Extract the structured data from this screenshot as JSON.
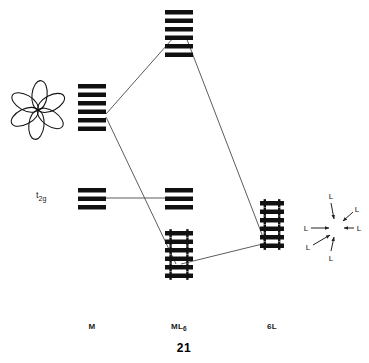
{
  "figure": {
    "number": "21",
    "type": "molecular-orbital-energy-level-diagram"
  },
  "columns": [
    {
      "key": "m",
      "label": "M",
      "label_sub": "",
      "x": 92,
      "label_y": 322
    },
    {
      "key": "ml6",
      "label": "ML",
      "label_sub": "6",
      "x": 179,
      "label_y": 322
    },
    {
      "key": "l6",
      "label": "6L",
      "label_sub": "",
      "x": 272,
      "label_y": 322
    }
  ],
  "orbital_labels": [
    {
      "text": "t",
      "sub": "2g",
      "x": 36,
      "y": 196
    }
  ],
  "ligand_field": {
    "center_x": 337,
    "center_y": 228,
    "ligands": [
      {
        "label": "L",
        "lx": 331,
        "ly": 196,
        "ax1": 331,
        "ay1": 203,
        "ax2": 334,
        "ay2": 219
      },
      {
        "label": "L",
        "lx": 357,
        "ly": 209,
        "ax1": 353,
        "ay1": 212,
        "ax2": 343,
        "ay2": 221
      },
      {
        "label": "L",
        "lx": 359,
        "ly": 228,
        "ax1": 354,
        "ay1": 228,
        "ax2": 344,
        "ay2": 228
      },
      {
        "label": "L",
        "lx": 306,
        "ly": 228,
        "ax1": 311,
        "ay1": 228,
        "ax2": 329,
        "ay2": 228
      },
      {
        "label": "L",
        "lx": 308,
        "ly": 247,
        "ax1": 313,
        "ay1": 245,
        "ax2": 330,
        "ay2": 235
      },
      {
        "label": "L",
        "lx": 331,
        "ly": 258,
        "ax1": 331,
        "ay1": 251,
        "ax2": 334,
        "ay2": 237
      }
    ]
  },
  "chart_data": {
    "type": "diagram",
    "xlabel": "",
    "ylabel": "Energy",
    "axis_ranges": {
      "x": [
        0,
        369
      ],
      "y_note": "energy increases upward; pixel y inverted"
    },
    "grid": false,
    "legend_position": "none",
    "categories": [
      "M",
      "ML6",
      "6L"
    ],
    "level_groups": [
      {
        "column": "m",
        "name": "metal-valence-orbitals",
        "count": 6,
        "x_center": 92,
        "bar_width": 28,
        "bar_height": 4.5,
        "spacing": 8.5,
        "top_y": 84,
        "electrons_per_level": 0,
        "description": "six metal s/p/d valence orbitals drawn as stacked bars"
      },
      {
        "column": "m",
        "name": "metal-t2g",
        "count": 3,
        "x_center": 92,
        "bar_width": 28,
        "bar_height": 4.5,
        "spacing": 8.5,
        "top_y": 188,
        "electrons_per_level": 0,
        "description": "metal t2g set"
      },
      {
        "column": "ml6",
        "name": "antibonding-set",
        "count": 6,
        "x_center": 179,
        "bar_width": 28,
        "bar_height": 4.5,
        "spacing": 8.5,
        "top_y": 10,
        "electrons_per_level": 0,
        "description": "six antibonding molecular orbitals"
      },
      {
        "column": "ml6",
        "name": "nonbonding-t2g",
        "count": 3,
        "x_center": 179,
        "bar_width": 28,
        "bar_height": 4.5,
        "spacing": 8.5,
        "top_y": 188,
        "electrons_per_level": 0,
        "description": "nonbonding t2g molecular orbitals"
      },
      {
        "column": "ml6",
        "name": "bonding-set",
        "count": 6,
        "x_center": 179,
        "bar_width": 28,
        "bar_height": 4.5,
        "spacing": 8.5,
        "top_y": 231,
        "electrons_per_level": 2,
        "description": "six filled bonding molecular orbitals, each with an electron pair"
      },
      {
        "column": "l6",
        "name": "ligand-lone-pairs",
        "count": 6,
        "x_center": 272,
        "bar_width": 24,
        "bar_height": 4.5,
        "spacing": 8.5,
        "top_y": 201,
        "electrons_per_level": 2,
        "description": "six filled ligand sigma-donor orbitals, each with an electron pair"
      }
    ],
    "correlation_lines": [
      {
        "from": [
          106,
          114
        ],
        "to": [
          174,
          37
        ],
        "name": "metal-to-antibonding-left"
      },
      {
        "from": [
          186,
          37
        ],
        "to": [
          264,
          241
        ],
        "name": "antibonding-to-ligand-right"
      },
      {
        "from": [
          106,
          117
        ],
        "to": [
          176,
          264
        ],
        "name": "metal-to-bonding"
      },
      {
        "from": [
          182,
          264
        ],
        "to": [
          264,
          243
        ],
        "name": "bonding-to-ligand"
      },
      {
        "from": [
          106,
          198
        ],
        "to": [
          165,
          198
        ],
        "name": "t2g-horizontal-correlation"
      }
    ],
    "orbital_sketch": {
      "name": "d-orbital-rosette",
      "center": [
        38,
        110
      ],
      "lobes": 6,
      "description": "rosette of overlapping lobes representing the metal d orbital set"
    }
  }
}
